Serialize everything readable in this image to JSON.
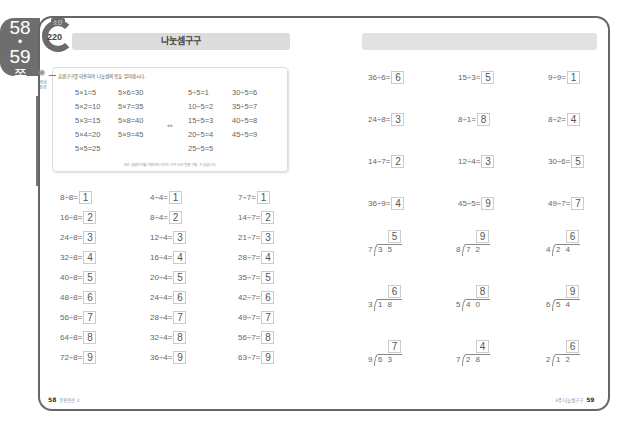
{
  "side_tab": {
    "page_a": "58",
    "dot": "•",
    "page_b": "59",
    "suffix": "쪽"
  },
  "left": {
    "badge": {
      "label": "소단",
      "number": "220"
    },
    "title": "나눗셈구구",
    "concept": {
      "icon_label": "개념 정리",
      "heading": "곱셈구구를 이용하여 나눗셈의 몫을 알아봅시다.",
      "multiplication": [
        "5×1=5",
        "5×2=10",
        "5×3=15",
        "5×4=20",
        "5×5=25",
        "5×6=30",
        "5×7=35",
        "5×8=40",
        "5×9=45"
      ],
      "equiv_symbol": "⇔",
      "division": [
        "5÷5=1",
        "10÷5=2",
        "15÷5=3",
        "20÷5=4",
        "25÷5=5",
        "30÷5=6",
        "35÷5=7",
        "40÷5=8",
        "45÷5=9"
      ],
      "footnote": "5단 곱셈구구를 이용하여 나누는 수가 5인 몫을 구할 수 있습니다."
    },
    "problems": {
      "col1": [
        {
          "q": "8÷8=",
          "a": "1"
        },
        {
          "q": "16÷8=",
          "a": "2"
        },
        {
          "q": "24÷8=",
          "a": "3"
        },
        {
          "q": "32÷8=",
          "a": "4"
        },
        {
          "q": "40÷8=",
          "a": "5"
        },
        {
          "q": "48÷8=",
          "a": "6"
        },
        {
          "q": "56÷8=",
          "a": "7"
        },
        {
          "q": "64÷8=",
          "a": "8"
        },
        {
          "q": "72÷8=",
          "a": "9"
        }
      ],
      "col2": [
        {
          "q": "4÷4=",
          "a": "1"
        },
        {
          "q": "8÷4=",
          "a": "2"
        },
        {
          "q": "12÷4=",
          "a": "3"
        },
        {
          "q": "16÷4=",
          "a": "4"
        },
        {
          "q": "20÷4=",
          "a": "5"
        },
        {
          "q": "24÷4=",
          "a": "6"
        },
        {
          "q": "28÷4=",
          "a": "7"
        },
        {
          "q": "32÷4=",
          "a": "8"
        },
        {
          "q": "36÷4=",
          "a": "9"
        }
      ],
      "col3": [
        {
          "q": "7÷7=",
          "a": "1"
        },
        {
          "q": "14÷7=",
          "a": "2"
        },
        {
          "q": "21÷7=",
          "a": "3"
        },
        {
          "q": "28÷7=",
          "a": "4"
        },
        {
          "q": "35÷7=",
          "a": "5"
        },
        {
          "q": "42÷7=",
          "a": "6"
        },
        {
          "q": "49÷7=",
          "a": "7"
        },
        {
          "q": "56÷7=",
          "a": "8"
        },
        {
          "q": "63÷7=",
          "a": "9"
        }
      ]
    },
    "footer": {
      "page": "58",
      "label": "응용연산 2"
    }
  },
  "right": {
    "problems": [
      [
        {
          "q": "36÷6=",
          "a": "6"
        },
        {
          "q": "15÷3=",
          "a": "5"
        },
        {
          "q": "9÷9=",
          "a": "1"
        }
      ],
      [
        {
          "q": "24÷8=",
          "a": "3"
        },
        {
          "q": "8÷1=",
          "a": "8"
        },
        {
          "q": "8÷2=",
          "a": "4"
        }
      ],
      [
        {
          "q": "14÷7=",
          "a": "2"
        },
        {
          "q": "12÷4=",
          "a": "3"
        },
        {
          "q": "30÷6=",
          "a": "5"
        }
      ],
      [
        {
          "q": "36÷9=",
          "a": "4"
        },
        {
          "q": "45÷5=",
          "a": "9"
        },
        {
          "q": "49÷7=",
          "a": "7"
        }
      ]
    ],
    "long_division": [
      [
        {
          "divisor": "7",
          "dividend": "35",
          "q": "5"
        },
        {
          "divisor": "8",
          "dividend": "72",
          "q": "9"
        },
        {
          "divisor": "4",
          "dividend": "24",
          "q": "6"
        }
      ],
      [
        {
          "divisor": "3",
          "dividend": "18",
          "q": "6"
        },
        {
          "divisor": "5",
          "dividend": "40",
          "q": "8"
        },
        {
          "divisor": "6",
          "dividend": "54",
          "q": "9"
        }
      ],
      [
        {
          "divisor": "9",
          "dividend": "63",
          "q": "7"
        },
        {
          "divisor": "7",
          "dividend": "28",
          "q": "4"
        },
        {
          "divisor": "2",
          "dividend": "12",
          "q": "6"
        }
      ]
    ],
    "footer": {
      "page": "59",
      "label": "3주 나눗셈구구"
    }
  }
}
